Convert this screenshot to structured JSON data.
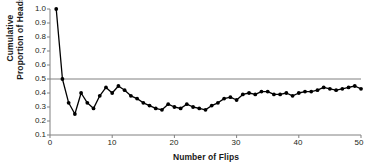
{
  "chart_data": {
    "type": "line",
    "title": "",
    "xlabel": "Number of Flips",
    "ylabel": "Cumulative Proportion of Heads",
    "ylabel_line1": "Cumulative",
    "ylabel_line2": "Proportion of Heads",
    "xlim": [
      0,
      50
    ],
    "ylim": [
      0.1,
      1.0
    ],
    "xticks": [
      0,
      10,
      20,
      30,
      40,
      50
    ],
    "xtick_labels": [
      "0",
      "10",
      "20",
      "30",
      "40",
      "50"
    ],
    "yticks": [
      0.1,
      0.2,
      0.3,
      0.4,
      0.5,
      0.6,
      0.7,
      0.8,
      0.9,
      1.0
    ],
    "ytick_labels": [
      "0.1",
      "0.2",
      "0.3",
      "0.4",
      "0.5",
      "0.6",
      "0.7",
      "0.8",
      "0.9",
      "1.0"
    ],
    "grid": false,
    "legend": null,
    "reference_line": {
      "orientation": "horizontal",
      "value": 0.5,
      "color": "#808080",
      "label": ""
    },
    "series": [
      {
        "name": "Cumulative proportion of heads",
        "marker": "circle",
        "color": "#000000",
        "x": [
          1,
          2,
          3,
          4,
          5,
          6,
          7,
          8,
          9,
          10,
          11,
          12,
          13,
          14,
          15,
          16,
          17,
          18,
          19,
          20,
          21,
          22,
          23,
          24,
          25,
          26,
          27,
          28,
          29,
          30,
          31,
          32,
          33,
          34,
          35,
          36,
          37,
          38,
          39,
          40,
          41,
          42,
          43,
          44,
          45,
          46,
          47,
          48,
          49,
          50
        ],
        "values": [
          1.0,
          0.5,
          0.33,
          0.25,
          0.4,
          0.33,
          0.29,
          0.38,
          0.44,
          0.4,
          0.45,
          0.42,
          0.38,
          0.36,
          0.33,
          0.31,
          0.29,
          0.28,
          0.32,
          0.3,
          0.29,
          0.32,
          0.3,
          0.29,
          0.28,
          0.31,
          0.33,
          0.36,
          0.37,
          0.35,
          0.39,
          0.4,
          0.39,
          0.41,
          0.41,
          0.39,
          0.39,
          0.4,
          0.38,
          0.4,
          0.41,
          0.41,
          0.42,
          0.44,
          0.43,
          0.42,
          0.43,
          0.44,
          0.45,
          0.43
        ]
      }
    ]
  },
  "axes": {
    "spine_color": "#808080",
    "tick_color": "#808080"
  }
}
